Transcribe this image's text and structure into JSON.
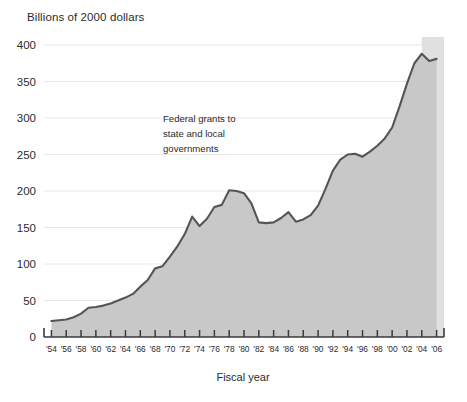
{
  "chart_data": {
    "type": "area",
    "title": "",
    "ylabel": "Billions of 2000 dollars",
    "xlabel": "Fiscal year",
    "series_name": "Federal grants to state and local governments",
    "annotation": {
      "lines": [
        "Federal grants to",
        "state and local",
        "governments"
      ]
    },
    "ylim": [
      0,
      400
    ],
    "yticks": [
      0,
      50,
      100,
      150,
      200,
      250,
      300,
      350,
      400
    ],
    "ytick_labels": [
      "0",
      "50",
      "100",
      "150",
      "200",
      "250",
      "300",
      "350",
      "400"
    ],
    "grid": true,
    "legend": "none",
    "xlim": [
      1953,
      2007
    ],
    "xticks": [
      1954,
      1956,
      1958,
      1960,
      1962,
      1964,
      1966,
      1968,
      1970,
      1972,
      1974,
      1976,
      1978,
      1980,
      1982,
      1984,
      1986,
      1988,
      1990,
      1992,
      1994,
      1996,
      1998,
      2000,
      2002,
      2004,
      2006
    ],
    "xtick_labels": [
      "'54",
      "'56",
      "'58",
      "'60",
      "'62",
      "'64",
      "'66",
      "'68",
      "'70",
      "'72",
      "'74",
      "'76",
      "'78",
      "'80",
      "'82",
      "'84",
      "'86",
      "'88",
      "'90",
      "'92",
      "'94",
      "'96",
      "'98",
      "'00",
      "'02",
      "'04",
      "'06"
    ],
    "projection_start_year": 2004,
    "colors": {
      "area_fill": "#c8c8c8",
      "projection_fill": "#e0e0e0",
      "line": "#555555",
      "grid": "#e8e8e8",
      "axis": "#3a3a3a",
      "text": "#2b2b2b"
    },
    "x": [
      1954,
      1955,
      1956,
      1957,
      1958,
      1959,
      1960,
      1961,
      1962,
      1963,
      1964,
      1965,
      1966,
      1967,
      1968,
      1969,
      1970,
      1971,
      1972,
      1973,
      1974,
      1975,
      1976,
      1977,
      1978,
      1979,
      1980,
      1981,
      1982,
      1983,
      1984,
      1985,
      1986,
      1987,
      1988,
      1989,
      1990,
      1991,
      1992,
      1993,
      1994,
      1995,
      1996,
      1997,
      1998,
      1999,
      2000,
      2001,
      2002,
      2003,
      2004,
      2005,
      2006
    ],
    "values": [
      22,
      23,
      24,
      27,
      32,
      40,
      41,
      43,
      46,
      50,
      54,
      59,
      69,
      78,
      94,
      97,
      110,
      124,
      141,
      165,
      152,
      162,
      178,
      181,
      201,
      200,
      197,
      183,
      157,
      156,
      157,
      163,
      171,
      158,
      161,
      167,
      180,
      203,
      228,
      243,
      250,
      251,
      247,
      254,
      262,
      272,
      287,
      316,
      347,
      375,
      388,
      378,
      381
    ]
  }
}
